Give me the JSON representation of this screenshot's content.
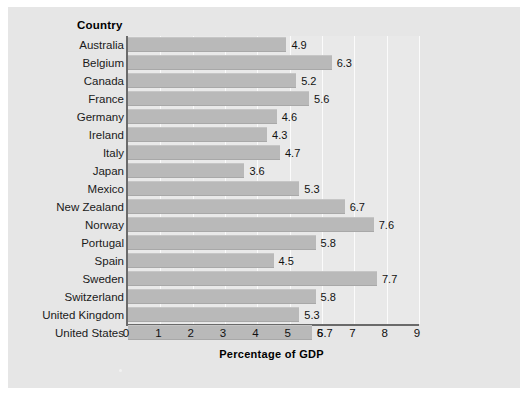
{
  "chart_data": {
    "type": "bar",
    "orientation": "horizontal",
    "title": "",
    "xlabel": "Percentage of GDP",
    "ylabel": "Country",
    "xlim": [
      0,
      9
    ],
    "xticks": [
      0,
      1,
      2,
      3,
      4,
      5,
      6,
      7,
      8,
      9
    ],
    "grid": true,
    "legend": false,
    "categories": [
      "Australia",
      "Belgium",
      "Canada",
      "France",
      "Germany",
      "Ireland",
      "Italy",
      "Japan",
      "Mexico",
      "New Zealand",
      "Norway",
      "Portugal",
      "Spain",
      "Sweden",
      "Switzerland",
      "United Kingdom",
      "United States"
    ],
    "values": [
      4.9,
      6.3,
      5.2,
      5.6,
      4.6,
      4.3,
      4.7,
      3.6,
      5.3,
      6.7,
      7.6,
      5.8,
      4.5,
      7.7,
      5.8,
      5.3,
      5.7
    ],
    "value_labels": [
      "4.9",
      "6.3",
      "5.2",
      "5.6",
      "4.6",
      "4.3",
      "4.7",
      "3.6",
      "5.3",
      "6.7",
      "7.6",
      "5.8",
      "4.5",
      "7.7",
      "5.8",
      "5.3",
      "5.7"
    ]
  },
  "colors": {
    "page_background": "#ffffff",
    "panel_background": "#e6e6e6",
    "plot_background": "#e9e9e9",
    "bar_fill": "#b9b9b9",
    "axis_line": "#6a6a6a",
    "gridline": "#fbfbfb",
    "text": "#111111"
  }
}
